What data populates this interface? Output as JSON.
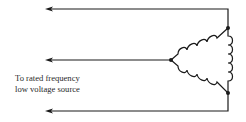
{
  "diagram": {
    "type": "delta-connected winding test circuit",
    "caption_lines": [
      "To rated frequency",
      "low voltage source"
    ],
    "leads": [
      {
        "name": "top-lead",
        "direction": "left-arrow"
      },
      {
        "name": "middle-lead",
        "direction": "left-arrow"
      },
      {
        "name": "bottom-lead",
        "direction": "left-arrow"
      }
    ],
    "windings": [
      {
        "name": "upper-left-winding",
        "turns": 4
      },
      {
        "name": "right-winding",
        "turns": 5
      },
      {
        "name": "lower-left-winding",
        "turns": 4
      }
    ],
    "nodes": [
      "top-node",
      "left-node",
      "bottom-node"
    ],
    "colors": {
      "line": "#1a1a1a",
      "text": "#2a2a2a",
      "background": "#ffffff"
    }
  }
}
